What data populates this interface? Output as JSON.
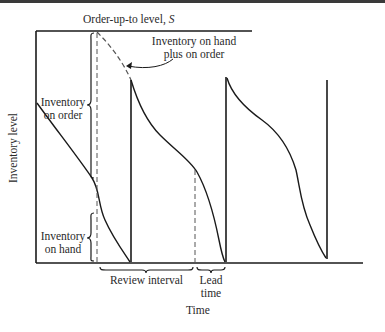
{
  "figure": {
    "title_top": "Order-up-to level, S",
    "title_top_prefix": "Order-up-to level, ",
    "title_top_symbol": "S",
    "callout_line1": "Inventory on hand",
    "callout_line2": "plus on order",
    "left_label_order_line1": "Inventory",
    "left_label_order_line2": "on order",
    "left_label_hand_line1": "Inventory",
    "left_label_hand_line2": "on hand",
    "y_axis_label": "Inventory level",
    "x_axis_label": "Time",
    "review_interval_label": "Review interval",
    "lead_time_line1": "Lead",
    "lead_time_line2": "time"
  },
  "colors": {
    "line": "#1a1a1a",
    "dashed": "#555555",
    "background": "#ffffff"
  }
}
